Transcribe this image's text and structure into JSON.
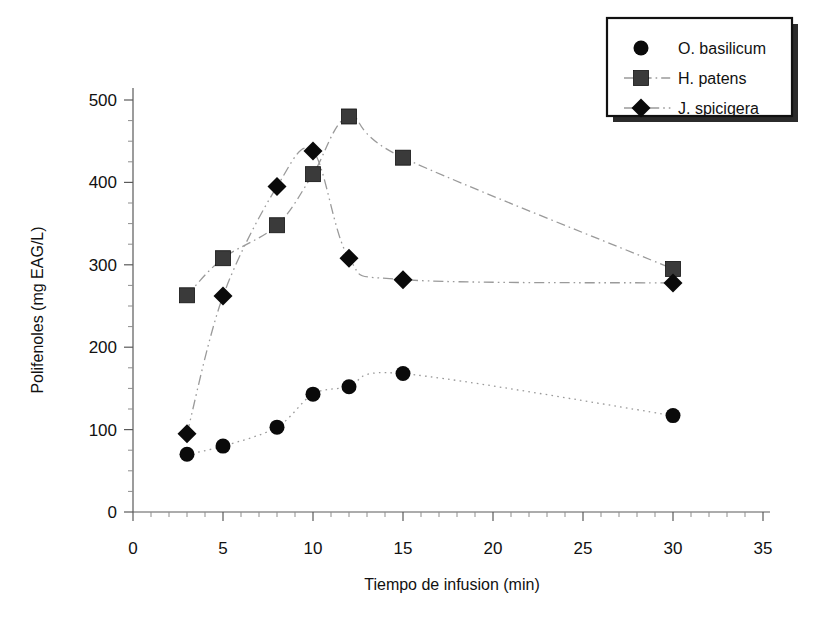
{
  "chart_data": {
    "type": "line",
    "title": "",
    "subtitle": "",
    "xlabel": "Tiempo de infusion (min)",
    "ylabel": "Polifenoles (mg EAG/L)",
    "xlim": [
      0,
      35
    ],
    "ylim": [
      0,
      500
    ],
    "x_ticks": [
      0,
      5,
      10,
      15,
      20,
      25,
      30,
      35
    ],
    "y_ticks": [
      0,
      100,
      200,
      300,
      400,
      500
    ],
    "x_minor_step": 1,
    "y_minor_step": 25,
    "grid": false,
    "legend_position": "top-right",
    "series": [
      {
        "name": "O. basilicum",
        "marker": "circle",
        "color": "#0a0a0a",
        "line_style": "dotted",
        "x": [
          3,
          5,
          8,
          10,
          12,
          15,
          30
        ],
        "values": [
          70,
          80,
          103,
          143,
          152,
          168,
          117
        ]
      },
      {
        "name": "H. patens",
        "marker": "square",
        "color": "#3a3a3a",
        "line_style": "dash-dot",
        "x": [
          3,
          5,
          8,
          10,
          12,
          15,
          30
        ],
        "values": [
          263,
          308,
          348,
          410,
          480,
          430,
          295
        ]
      },
      {
        "name": "J. spicigera",
        "marker": "diamond",
        "color": "#0a0a0a",
        "line_style": "dash-dot-dot",
        "x": [
          3,
          5,
          8,
          10,
          12,
          15,
          30
        ],
        "values": [
          95,
          262,
          395,
          438,
          308,
          282,
          278
        ]
      }
    ]
  },
  "axes": {
    "x_title": "Tiempo de infusion (min)",
    "y_title": "Polifenoles (mg EAG/L)",
    "x_tick_labels": [
      "0",
      "5",
      "10",
      "15",
      "20",
      "25",
      "30",
      "35"
    ],
    "y_tick_labels": [
      "0",
      "100",
      "200",
      "300",
      "400",
      "500"
    ]
  },
  "legend": {
    "entries": [
      {
        "label": "O. basilicum",
        "marker": "circle"
      },
      {
        "label": "H. patens",
        "marker": "square"
      },
      {
        "label": "J. spicigera",
        "marker": "diamond"
      }
    ]
  }
}
